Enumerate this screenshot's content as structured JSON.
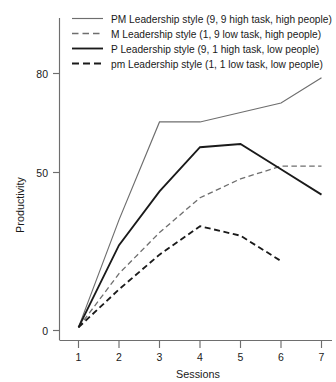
{
  "chart_data": {
    "type": "line",
    "title": "",
    "xlabel": "Sessions",
    "ylabel": "Productivity",
    "x": [
      1,
      2,
      3,
      4,
      5,
      6,
      7
    ],
    "xtick_labels": [
      "1",
      "2",
      "3",
      "4",
      "5",
      "6",
      "7"
    ],
    "ytick_labels": [
      "0",
      "50",
      "80"
    ],
    "ytick_values": [
      0,
      50,
      80
    ],
    "xlim": [
      0.72,
      7.18
    ],
    "ylim": [
      0,
      88
    ],
    "grid": false,
    "legend_position": "top-center",
    "series": [
      {
        "name": "PM Leadership style (9, 9 high task, high people)",
        "short_name": "PM",
        "style": "solid",
        "color": "#6e6e6e",
        "width": 1.15,
        "x": [
          1,
          2,
          3,
          4,
          5,
          6,
          7
        ],
        "values": [
          1,
          35,
          66,
          66,
          69,
          72,
          80
        ]
      },
      {
        "name": "M Leadership style (1, 9 low task, high people)",
        "short_name": "M",
        "style": "dashed",
        "color": "#6e6e6e",
        "width": 1.3,
        "x": [
          1,
          2,
          3,
          4,
          5,
          6,
          7
        ],
        "values": [
          1,
          18,
          31,
          42,
          48,
          52,
          52
        ]
      },
      {
        "name": "P Leadership style (9, 1 high task, low people)",
        "short_name": "P",
        "style": "solid",
        "color": "#1a1a1a",
        "width": 1.85,
        "x": [
          1,
          2,
          3,
          4,
          5,
          6,
          7
        ],
        "values": [
          1,
          27,
          44,
          58,
          59,
          51,
          43
        ]
      },
      {
        "name": "pm Leadership style (1, 1 low task, low people)",
        "short_name": "pm",
        "style": "dashed",
        "color": "#1a1a1a",
        "width": 1.85,
        "x": [
          1,
          2,
          3,
          4,
          5,
          6
        ],
        "values": [
          1,
          13,
          24,
          33,
          30,
          22
        ]
      }
    ]
  },
  "legend": {
    "entries": [
      {
        "label": "PM Leadership style (9, 9 high task, high people)"
      },
      {
        "label": "M Leadership style (1, 9 low task, high people)"
      },
      {
        "label": "P Leadership style (9, 1 high task, low people)"
      },
      {
        "label": "pm Leadership style (1, 1 low task, low people)"
      }
    ]
  },
  "axes": {
    "y_title": "Productivity",
    "x_title": "Sessions",
    "y_ticks": [
      "0",
      "50",
      "80"
    ],
    "x_ticks": [
      "1",
      "2",
      "3",
      "4",
      "5",
      "6",
      "7"
    ]
  }
}
